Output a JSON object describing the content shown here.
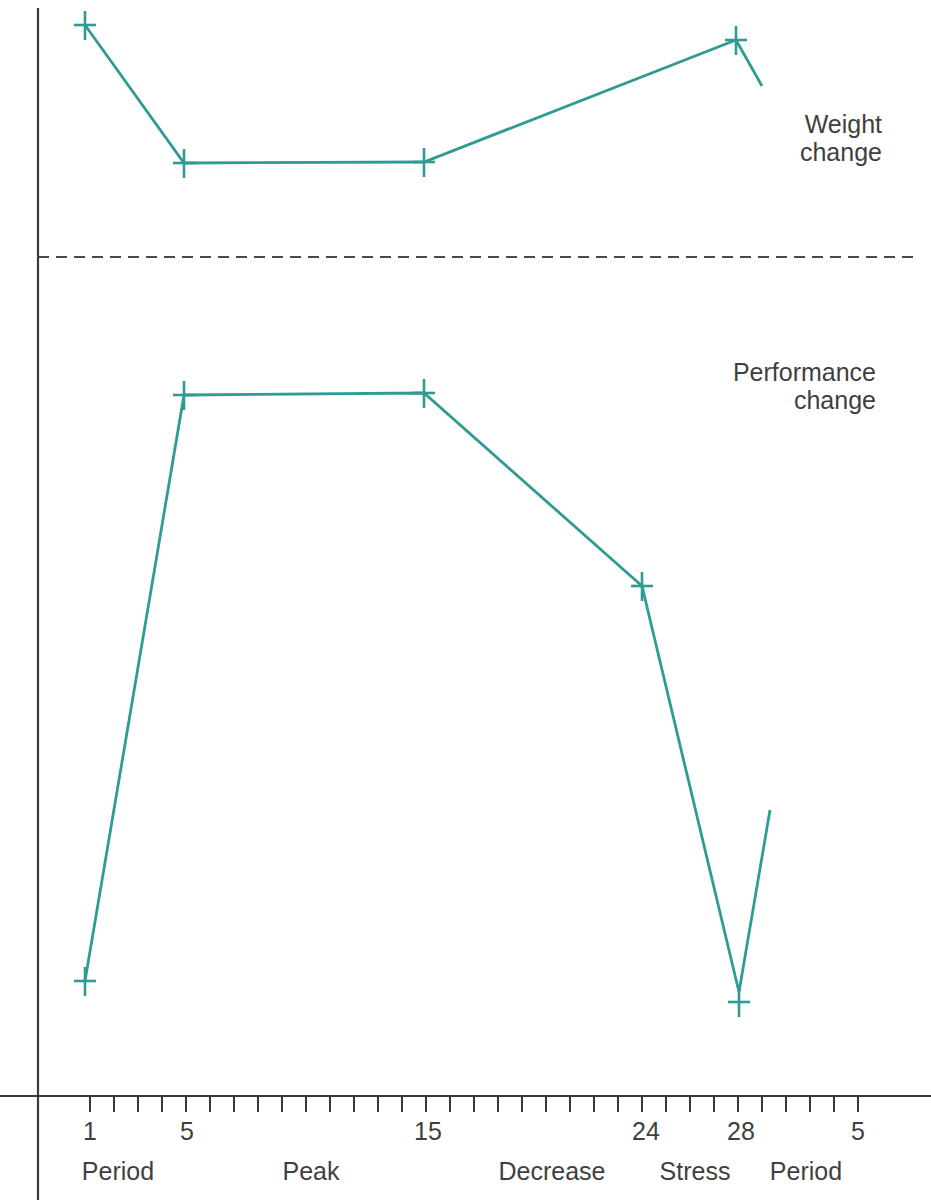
{
  "colors": {
    "background": "#ffffff",
    "series": "#2f9b94",
    "axis": "#3a3a3a",
    "text": "#3f3f3f",
    "divider": "#4a4a4a"
  },
  "chart_data": {
    "type": "line",
    "title": "",
    "panels": [
      {
        "name": "Weight change",
        "label_lines": [
          "Weight",
          "change"
        ],
        "y_region_px": [
          0,
          257
        ]
      },
      {
        "name": "Performance change",
        "label_lines": [
          "Performance",
          "change"
        ],
        "y_region_px": [
          257,
          1096
        ]
      }
    ],
    "x_axis": {
      "unit": "day",
      "axis_y_px": 1096,
      "x1_px": 0,
      "x2_px": 931,
      "tick_start_x_px": 90,
      "tick_spacing_px": 24,
      "tick_count": 33,
      "tick_length_px": 15,
      "tick_labels": [
        {
          "text": "1",
          "x_px": 90
        },
        {
          "text": "5",
          "x_px": 187
        },
        {
          "text": "15",
          "x_px": 428
        },
        {
          "text": "24",
          "x_px": 646
        },
        {
          "text": "28",
          "x_px": 741
        },
        {
          "text": "5",
          "x_px": 858
        }
      ],
      "phase_labels": [
        {
          "text": "Period",
          "x_px": 118
        },
        {
          "text": "Peak",
          "x_px": 311
        },
        {
          "text": "Decrease",
          "x_px": 552
        },
        {
          "text": "Stress",
          "x_px": 695
        },
        {
          "text": "Period",
          "x_px": 806
        }
      ],
      "tick_label_baseline_y_px": 1140,
      "phase_label_baseline_y_px": 1180
    },
    "y_axis": {
      "x_px": 38,
      "y1_px": 8,
      "y2_px": 1200,
      "labels": "none"
    },
    "divider": {
      "style": "dashed",
      "y_px": 257,
      "x1_px": 38,
      "x2_px": 917,
      "dash_px": 11,
      "gap_px": 7
    },
    "series": [
      {
        "name": "Weight change",
        "marker": "plus",
        "points": [
          {
            "day": 1,
            "x_px": 85,
            "y_px": 25
          },
          {
            "day": 5,
            "x_px": 184,
            "y_px": 163
          },
          {
            "day": 15,
            "x_px": 424,
            "y_px": 162
          },
          {
            "day": 28,
            "x_px": 736,
            "y_px": 40
          }
        ],
        "tail_point": {
          "x_px": 762,
          "y_px": 86
        },
        "trend": "high at day 1, drops to low by day 5, flat through day 15, rises to high at day 28, then falls again"
      },
      {
        "name": "Performance change",
        "marker": "plus",
        "points": [
          {
            "day": 1,
            "x_px": 85,
            "y_px": 981
          },
          {
            "day": 5,
            "x_px": 184,
            "y_px": 395
          },
          {
            "day": 15,
            "x_px": 424,
            "y_px": 393
          },
          {
            "day": 24,
            "x_px": 642,
            "y_px": 586
          },
          {
            "day": 28,
            "x_px": 739,
            "y_px": 1002,
            "line_y_px": 992
          }
        ],
        "tail_point": {
          "x_px": 770,
          "y_px": 810
        },
        "trend": "low at day 1, peaks by day 5, flat through day 15, declines at day 24, very low at day 28, then rises again"
      }
    ]
  },
  "figure": {
    "kind": "scanned textbook line figure",
    "x_label_row": "1 5 15 24 28 5",
    "phase_row": "Period Peak Decrease Stress Period"
  }
}
